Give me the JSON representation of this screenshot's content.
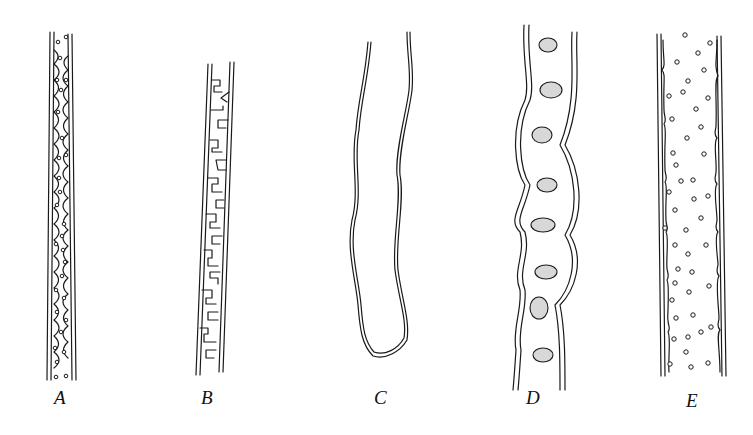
{
  "figure": {
    "panels": [
      {
        "id": "A",
        "label": "A",
        "description": "filament with rounded cells and dots"
      },
      {
        "id": "B",
        "label": "B",
        "description": "filament with zig-zag folded cell walls"
      },
      {
        "id": "C",
        "label": "C",
        "description": "U-shaped wavy double-walled tube"
      },
      {
        "id": "D",
        "label": "D",
        "description": "twisted filament with stippled lateral bodies"
      },
      {
        "id": "E",
        "label": "E",
        "description": "wide filament with scattered circles"
      }
    ]
  }
}
